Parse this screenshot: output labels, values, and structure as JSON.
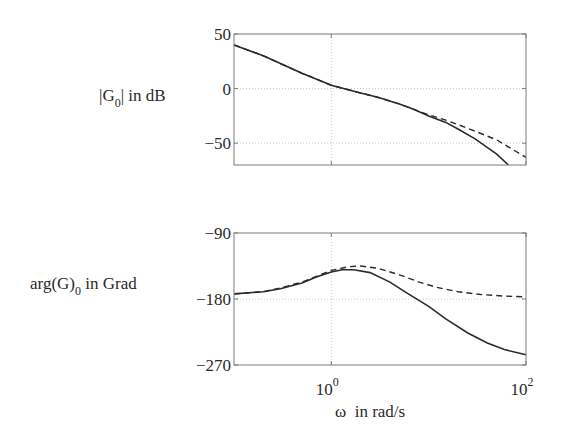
{
  "chart_data": [
    {
      "type": "line",
      "title": "",
      "ylabel_parts": {
        "pre": "|G",
        "sub": "0",
        "post": "| in dB"
      },
      "xlabel": "",
      "xscale": "log",
      "xlim": [
        0.1,
        100
      ],
      "ylim": [
        -70,
        50
      ],
      "yticks": [
        50,
        0,
        -50
      ],
      "ytick_labels": [
        "50",
        "0",
        "−50"
      ],
      "xticks": [
        1,
        100
      ],
      "grid": true,
      "series": [
        {
          "name": "solid",
          "style": "solid",
          "x": [
            0.1,
            0.2,
            0.5,
            1,
            2,
            3,
            5,
            7,
            10,
            15,
            20,
            30,
            50,
            66
          ],
          "values": [
            40,
            30,
            14,
            3,
            -4,
            -8,
            -14,
            -19,
            -25,
            -31,
            -37,
            -46,
            -60,
            -70
          ]
        },
        {
          "name": "dashed",
          "style": "dashed",
          "x": [
            0.1,
            0.2,
            0.5,
            1,
            2,
            3,
            5,
            7,
            10,
            15,
            20,
            30,
            50,
            100
          ],
          "values": [
            40,
            30,
            14,
            3,
            -4,
            -8,
            -14,
            -19,
            -24,
            -29,
            -33,
            -39,
            -47,
            -63
          ]
        }
      ]
    },
    {
      "type": "line",
      "title": "",
      "ylabel_parts": {
        "pre": "arg(G)",
        "sub": "0",
        "post": " in Grad"
      },
      "xlabel": "ω  in rad/s",
      "xscale": "log",
      "xlim": [
        0.1,
        100
      ],
      "ylim": [
        -270,
        -90
      ],
      "yticks": [
        -90,
        -180,
        -270
      ],
      "ytick_labels": [
        "−90",
        "−180",
        "−270"
      ],
      "xticks": [
        1,
        100
      ],
      "xtick_labels": [
        {
          "base": "10",
          "exp": "0"
        },
        {
          "base": "10",
          "exp": "2"
        }
      ],
      "grid": true,
      "series": [
        {
          "name": "solid",
          "style": "solid",
          "x": [
            0.1,
            0.2,
            0.3,
            0.5,
            0.7,
            1,
            1.3,
            1.7,
            2.5,
            4,
            6,
            10,
            15,
            25,
            40,
            60,
            100
          ],
          "values": [
            -173,
            -170,
            -166,
            -158,
            -150,
            -143,
            -140,
            -140,
            -144,
            -157,
            -172,
            -190,
            -207,
            -226,
            -240,
            -249,
            -256
          ]
        },
        {
          "name": "dashed",
          "style": "dashed",
          "x": [
            0.1,
            0.2,
            0.3,
            0.5,
            0.7,
            1,
            1.5,
            2,
            3,
            5,
            8,
            12,
            20,
            35,
            60,
            100
          ],
          "values": [
            -173,
            -170,
            -165,
            -157,
            -149,
            -141,
            -136,
            -135,
            -138,
            -147,
            -157,
            -164,
            -170,
            -174,
            -176,
            -177
          ]
        }
      ]
    }
  ]
}
